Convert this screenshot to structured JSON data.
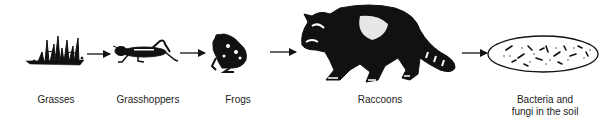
{
  "diagram": {
    "type": "food-chain",
    "nodes": [
      {
        "id": "grasses",
        "label": "Grasses",
        "icon": "grass-icon"
      },
      {
        "id": "grasshoppers",
        "label": "Grasshoppers",
        "icon": "grasshopper-icon"
      },
      {
        "id": "frogs",
        "label": "Frogs",
        "icon": "frog-icon"
      },
      {
        "id": "raccoons",
        "label": "Raccoons",
        "icon": "raccoon-icon"
      },
      {
        "id": "decomposers",
        "label_line1": "Bacteria and",
        "label_line2": "fungi in the soil",
        "icon": "soil-microbes-icon"
      }
    ],
    "edges": [
      {
        "from": "grasses",
        "to": "grasshoppers"
      },
      {
        "from": "grasshoppers",
        "to": "frogs"
      },
      {
        "from": "frogs",
        "to": "raccoons"
      },
      {
        "from": "raccoons",
        "to": "decomposers"
      }
    ],
    "colors": {
      "ink": "#111111",
      "background": "#ffffff"
    }
  }
}
